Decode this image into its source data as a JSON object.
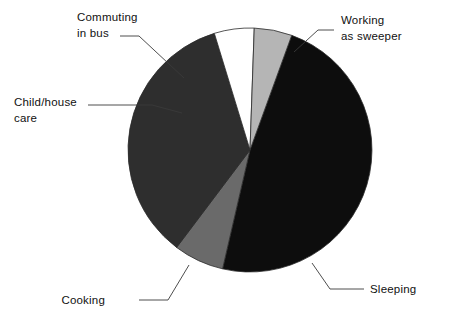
{
  "chart_data": {
    "type": "pie",
    "title": "",
    "subtitle": "",
    "xlabel": "",
    "ylabel": "",
    "legend_position": "none",
    "grid": false,
    "labels_position": "outside-with-leader-lines",
    "categories": [
      "Working as sweeper",
      "Sleeping",
      "Cooking",
      "Child/house care",
      "Commuting in bus"
    ],
    "values": [
      38,
      7,
      40,
      6,
      9
    ],
    "units": "percent",
    "slices": [
      {
        "label": "Working as sweeper",
        "label_line1": "Working",
        "label_line2": "as sweeper",
        "value": 38,
        "color": "#0d0d0d",
        "start_angle": -70,
        "end_angle": 103
      },
      {
        "label": "Sleeping",
        "label_line1": "Sleeping",
        "label_line2": "",
        "value": 7,
        "color": "#6a6a6a",
        "start_angle": 103,
        "end_angle": 127
      },
      {
        "label": "Cooking",
        "label_line1": "Cooking",
        "label_line2": "",
        "value": 40,
        "color": "#2e2e2e",
        "start_angle": 127,
        "end_angle": 253
      },
      {
        "label": "Child/house care",
        "label_line1": "Child/house",
        "label_line2": "care",
        "value": 6,
        "color": "#ffffff",
        "start_angle": 253,
        "end_angle": 272
      },
      {
        "label": "Commuting in bus",
        "label_line1": "Commuting",
        "label_line2": "in bus",
        "value": 9,
        "color": "#b5b5b5",
        "start_angle": 272,
        "end_angle": 290
      }
    ],
    "geometry": {
      "center_x": 250,
      "center_y": 150,
      "radius": 122
    },
    "colors": {
      "working_as_sweeper": "#0d0d0d",
      "sleeping": "#6a6a6a",
      "cooking": "#2e2e2e",
      "child_house_care": "#ffffff",
      "commuting_in_bus": "#b5b5b5",
      "outline": "#2b2b2b",
      "text": "#111111",
      "background": "#ffffff"
    }
  },
  "labels": {
    "commuting": {
      "line1": "Commuting",
      "line2": "in bus"
    },
    "childcare": {
      "line1": "Child/house",
      "line2": "care"
    },
    "working": {
      "line1": "Working",
      "line2": "as sweeper"
    },
    "sleeping": {
      "line1": "Sleeping",
      "line2": ""
    },
    "cooking": {
      "line1": "Cooking",
      "line2": ""
    }
  }
}
